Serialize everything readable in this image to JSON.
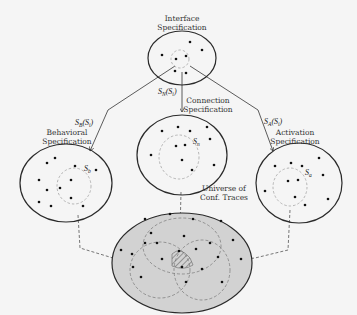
{
  "diagram": {
    "nodes": {
      "interface": {
        "label_line1": "Interface",
        "label_line2": "Specification"
      },
      "connection": {
        "label_line1": "Connection",
        "label_line2": "Specification",
        "subset": "S",
        "subset_sub": "n"
      },
      "behavioral": {
        "label_line1": "Behavioral",
        "label_line2": "Specification",
        "subset": "S",
        "subset_sub": "b"
      },
      "activation": {
        "label_line1": "Activation",
        "label_line2": "Specification",
        "subset": "S",
        "subset_sub": "a"
      },
      "universe": {
        "label_line1": "Universe of",
        "label_line2": "Conf. Traces"
      }
    },
    "edges": {
      "to_connection": {
        "fn": "S",
        "fn_sub": "N",
        "arg": "(S",
        "arg_sub": "i",
        "close": ")"
      },
      "to_behavioral": {
        "fn": "S",
        "fn_sub": "B",
        "arg": "(S",
        "arg_sub": "i",
        "close": ")"
      },
      "to_activation": {
        "fn": "S",
        "fn_sub": "A",
        "arg": "(S",
        "arg_sub": "i",
        "close": ")"
      }
    },
    "colors": {
      "background": "#f5f5f5",
      "outline": "#2a2a2a",
      "universe_fill": "#d2d2d2",
      "dashed": "#8a8a8a",
      "dot": "#111111"
    }
  }
}
